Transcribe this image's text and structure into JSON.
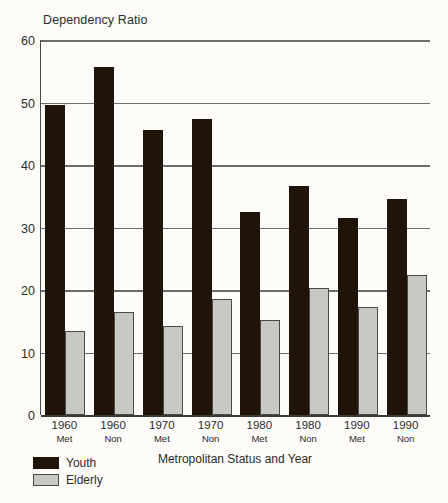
{
  "chart_data": {
    "type": "bar",
    "title": "Dependency Ratio",
    "xlabel": "Metropolitan Status and Year",
    "ylabel": "",
    "ylim": [
      0,
      60
    ],
    "yticks": [
      0,
      10,
      20,
      30,
      40,
      50,
      60
    ],
    "grid": true,
    "legend_position": "bottom-left",
    "categories": [
      {
        "year": "1960",
        "status": "Met"
      },
      {
        "year": "1960",
        "status": "Non"
      },
      {
        "year": "1970",
        "status": "Met"
      },
      {
        "year": "1970",
        "status": "Non"
      },
      {
        "year": "1980",
        "status": "Met"
      },
      {
        "year": "1980",
        "status": "Non"
      },
      {
        "year": "1990",
        "status": "Met"
      },
      {
        "year": "1990",
        "status": "Non"
      }
    ],
    "series": [
      {
        "name": "Youth",
        "color": "#201309",
        "values": [
          49.6,
          55.7,
          45.6,
          47.4,
          32.5,
          36.7,
          31.5,
          34.6
        ]
      },
      {
        "name": "Elderly",
        "color": "#c9c9c4",
        "values": [
          13.5,
          16.5,
          14.3,
          18.5,
          15.2,
          20.4,
          17.3,
          22.4
        ]
      }
    ]
  },
  "legend": {
    "items": [
      {
        "label": "Youth",
        "key": "youth"
      },
      {
        "label": "Elderly",
        "key": "elderly"
      }
    ]
  },
  "colors": {
    "background": "#fdfcf8",
    "axis": "#4a4a46",
    "grid": "#6e6e68",
    "youth": "#201309",
    "elderly": "#c9c9c4"
  }
}
